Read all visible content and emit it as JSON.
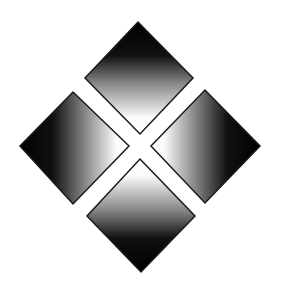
{
  "graphic": {
    "description": "Four gradient diamonds arranged in a diamond pattern separated by a white X",
    "background": "#ffffff",
    "stroke_color": "#1a1a1a",
    "dark_color": "#050505",
    "light_color": "#ffffff",
    "diamonds": [
      {
        "name": "top",
        "points": "138,22 193,78 140,134 85,78"
      },
      {
        "name": "left",
        "points": "20,146 73,92 129,146 73,204"
      },
      {
        "name": "right",
        "points": "151,146 205,90 260,146 205,203"
      },
      {
        "name": "bottom",
        "points": "140,159 195,216 141,272 87,216"
      }
    ]
  }
}
